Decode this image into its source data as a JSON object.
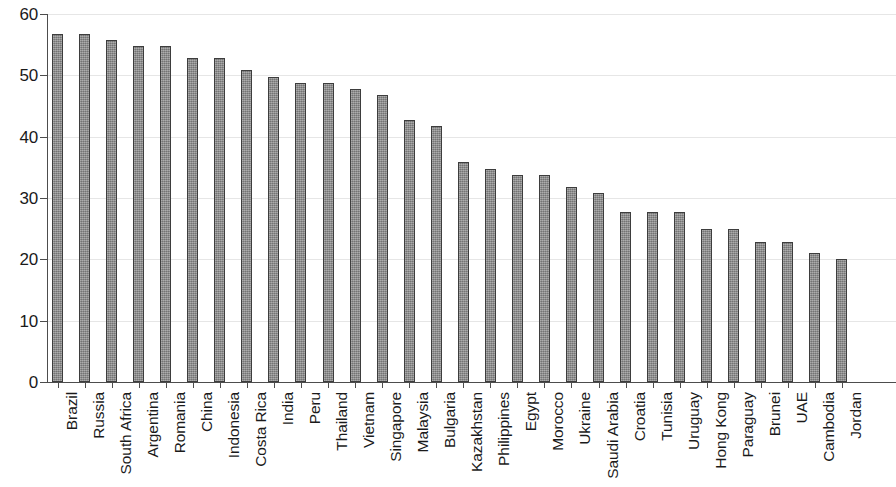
{
  "chart_data": {
    "type": "bar",
    "title": "",
    "subtitle": "",
    "xlabel": "",
    "ylabel": "",
    "ylim": [
      0,
      60
    ],
    "xlim_categories": 31,
    "grid": true,
    "legend": null,
    "y_ticks": [
      0,
      10,
      20,
      30,
      40,
      50,
      60
    ],
    "y_tick_labels": [
      "0",
      "10",
      "20",
      "30",
      "40",
      "50",
      "60"
    ],
    "bar_color": "#8c8c8c",
    "bar_edge_color": "#3d3d3d",
    "gridline_color": "#e6e6e6",
    "axis_color": "#4d4d4d",
    "categories": [
      "Brazil",
      "Russia",
      "South Africa",
      "Argentina",
      "Romania",
      "China",
      "Indonesia",
      "Costa Rica",
      "India",
      "Peru",
      "Thailand",
      "Vietnam",
      "Singapore",
      "Malaysia",
      "Bulgaria",
      "Kazakhstan",
      "Philippines",
      "Egypt",
      "Morocco",
      "Ukraine",
      "Saudi Arabia",
      "Croatia",
      "Tunisia",
      "Uruguay",
      "Hong Kong",
      "Paraguay",
      "Brunei",
      "UAE",
      "Cambodia",
      "Jordan"
    ],
    "values": [
      56.8,
      56.7,
      55.8,
      54.8,
      54.8,
      52.8,
      52.8,
      50.8,
      49.7,
      48.8,
      48.8,
      47.8,
      46.8,
      42.7,
      41.8,
      35.8,
      34.8,
      33.8,
      33.8,
      31.8,
      30.8,
      27.8,
      27.8,
      27.8,
      24.9,
      24.9,
      22.9,
      22.9,
      21.0,
      20.0
    ]
  }
}
